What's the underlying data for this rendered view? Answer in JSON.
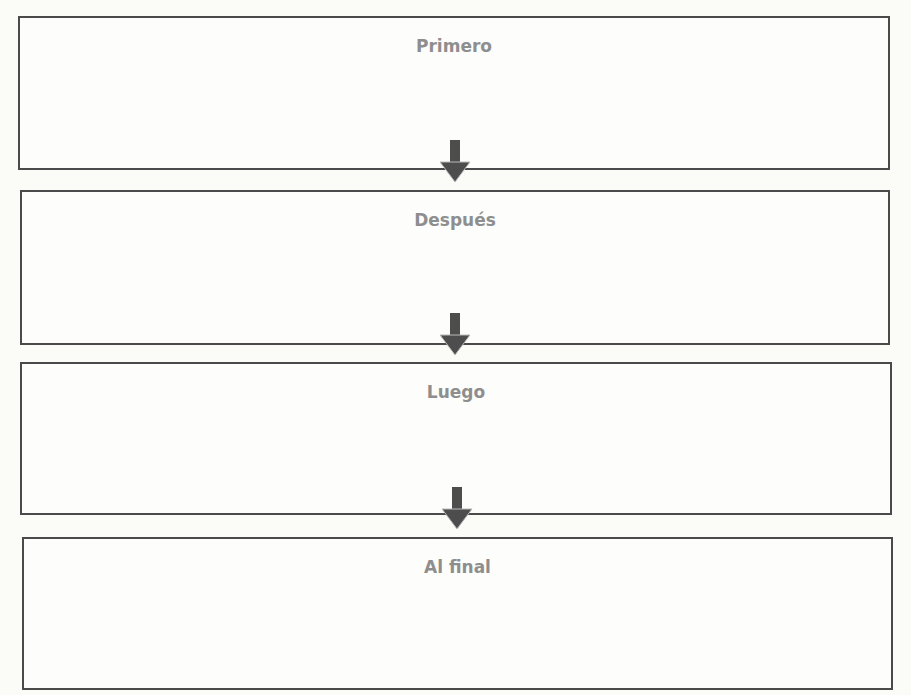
{
  "sequence_organizer": {
    "boxes": [
      {
        "label": "Primero"
      },
      {
        "label": "Después"
      },
      {
        "label": "Luego"
      },
      {
        "label": "Al final"
      }
    ],
    "colors": {
      "border": "#4a4a4a",
      "label": "#8e8e8e",
      "arrow": "#4d4d4d"
    }
  }
}
